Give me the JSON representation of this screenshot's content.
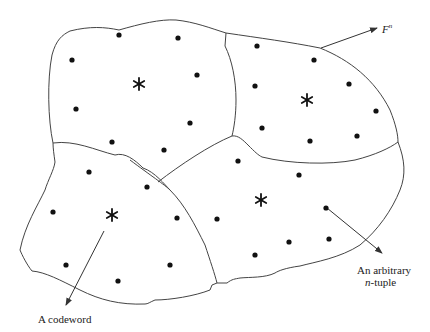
{
  "diagram": {
    "labels": {
      "space": "F",
      "space_superscript": "n",
      "codeword": "A codeword",
      "ntuple_line1": "An arbitrary",
      "ntuple_italic": "n",
      "ntuple_line2_rest": "-tuple"
    },
    "colors": {
      "stroke": "#444444",
      "dot": "#111111",
      "background": "#ffffff"
    },
    "regions": [
      {
        "name": "top-left",
        "codeword_center": [
          139,
          84
        ]
      },
      {
        "name": "top-right",
        "codeword_center": [
          307,
          100
        ]
      },
      {
        "name": "bottom-right",
        "codeword_center": [
          260,
          200
        ]
      },
      {
        "name": "bottom-left",
        "codeword_center": [
          112,
          215
        ]
      }
    ],
    "dots": [
      [
        119,
        35
      ],
      [
        178,
        38
      ],
      [
        72,
        60
      ],
      [
        197,
        75
      ],
      [
        76,
        109
      ],
      [
        190,
        123
      ],
      [
        112,
        142
      ],
      [
        164,
        150
      ],
      [
        257,
        46
      ],
      [
        314,
        60
      ],
      [
        255,
        86
      ],
      [
        349,
        84
      ],
      [
        262,
        128
      ],
      [
        376,
        111
      ],
      [
        310,
        141
      ],
      [
        357,
        136
      ],
      [
        238,
        161
      ],
      [
        299,
        175
      ],
      [
        326,
        208
      ],
      [
        217,
        219
      ],
      [
        289,
        242
      ],
      [
        329,
        239
      ],
      [
        255,
        255
      ],
      [
        89,
        172
      ],
      [
        147,
        187
      ],
      [
        53,
        212
      ],
      [
        177,
        218
      ],
      [
        66,
        265
      ],
      [
        170,
        265
      ],
      [
        118,
        281
      ]
    ]
  }
}
